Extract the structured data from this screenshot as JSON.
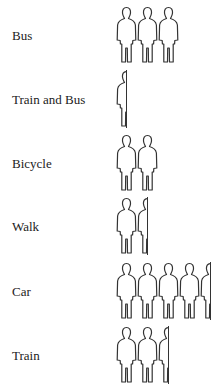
{
  "chart_data": {
    "type": "pictogram",
    "title": "",
    "unit_icon": "person-icon",
    "categories": [
      "Bus",
      "Train and Bus",
      "Bicycle",
      "Walk",
      "Car",
      "Train"
    ],
    "values": [
      3,
      0.5,
      2,
      1.5,
      4.5,
      2.5
    ],
    "legend": []
  },
  "rows": [
    {
      "label": "Bus",
      "value": 3
    },
    {
      "label": "Train and Bus",
      "value": 0.5
    },
    {
      "label": "Bicycle",
      "value": 2
    },
    {
      "label": "Walk",
      "value": 1.5
    },
    {
      "label": "Car",
      "value": 4.5
    },
    {
      "label": "Train",
      "value": 2.5
    }
  ]
}
